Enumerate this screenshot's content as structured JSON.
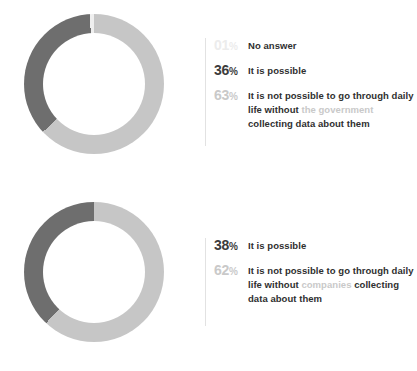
{
  "colors": {
    "dark_segment": "#6e6e6e",
    "light_segment": "#c6c6c6",
    "faint_segment": "#efefef",
    "text_dark": "#2f2f2f",
    "text_muted": "#c9c9c9",
    "rule": "#e2e2e2",
    "background": "#ffffff"
  },
  "chart_data": [
    {
      "type": "pie",
      "id": "government-donut",
      "title": "",
      "legend_position": "right",
      "categories": [
        "It is not possible to go through daily life without the government collecting data about them",
        "It is possible",
        "No answer"
      ],
      "values": [
        63,
        36,
        1
      ],
      "units": "%",
      "colors": [
        "#c6c6c6",
        "#6e6e6e",
        "#efefef"
      ],
      "legend": [
        {
          "percent": "01",
          "symbol": "%",
          "tone": "faint",
          "label_parts": [
            {
              "text": "No answer",
              "muted": false
            }
          ]
        },
        {
          "percent": "36",
          "symbol": "%",
          "tone": "dark",
          "label_parts": [
            {
              "text": "It is possible",
              "muted": false
            }
          ]
        },
        {
          "percent": "63",
          "symbol": "%",
          "tone": "mid",
          "label_parts": [
            {
              "text": "It is not possible to go through daily life without ",
              "muted": false
            },
            {
              "text": "the government",
              "muted": true
            },
            {
              "text": " collecting data about them",
              "muted": false
            }
          ]
        }
      ]
    },
    {
      "type": "pie",
      "id": "companies-donut",
      "title": "",
      "legend_position": "right",
      "categories": [
        "It is not possible to go through daily life without companies collecting data about them",
        "It is possible"
      ],
      "values": [
        62,
        38
      ],
      "units": "%",
      "colors": [
        "#c6c6c6",
        "#6e6e6e"
      ],
      "legend": [
        {
          "percent": "38",
          "symbol": "%",
          "tone": "dark",
          "label_parts": [
            {
              "text": "It is possible",
              "muted": false
            }
          ]
        },
        {
          "percent": "62",
          "symbol": "%",
          "tone": "mid",
          "label_parts": [
            {
              "text": "It is not possible to go through daily life without ",
              "muted": false
            },
            {
              "text": "companies",
              "muted": true
            },
            {
              "text": " collecting data about them",
              "muted": false
            }
          ]
        }
      ]
    }
  ]
}
